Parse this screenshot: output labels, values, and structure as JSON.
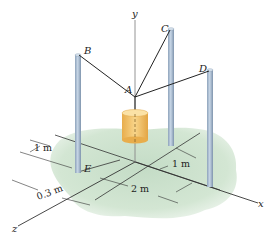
{
  "figure": {
    "type": "3D statics diagram",
    "axes": {
      "x": "x",
      "y": "y",
      "z": "z"
    },
    "points": {
      "A": "A",
      "B": "B",
      "C": "C",
      "D": "D",
      "E": "E"
    },
    "dimensions": {
      "d1": "1 m",
      "d2": "1 m",
      "d3": "0.3 m",
      "d4": "2 m"
    },
    "colors": {
      "ground": "#cfe3cf",
      "pole": "#a9bdd3",
      "pole_shadow": "#7f94ad",
      "cylinder": "#f2c46a",
      "cylinder_dark": "#e0a94a",
      "cable": "#222222",
      "axis": "#333333"
    }
  }
}
